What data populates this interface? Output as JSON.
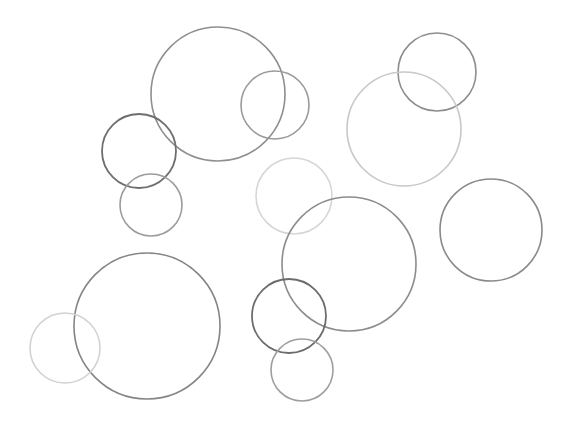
{
  "canvas": {
    "width": 576,
    "height": 421,
    "background": "#ffffff"
  },
  "circles": [
    {
      "cx": 218,
      "cy": 94,
      "r": 67,
      "stroke": "#8f8f8f",
      "width": 1.6
    },
    {
      "cx": 275,
      "cy": 105,
      "r": 34,
      "stroke": "#9a9a9a",
      "width": 1.6
    },
    {
      "cx": 139,
      "cy": 151,
      "r": 37,
      "stroke": "#6e6e6e",
      "width": 1.8
    },
    {
      "cx": 151,
      "cy": 205,
      "r": 31,
      "stroke": "#9c9c9c",
      "width": 1.6
    },
    {
      "cx": 437,
      "cy": 72,
      "r": 39,
      "stroke": "#8e8e8e",
      "width": 1.6
    },
    {
      "cx": 404,
      "cy": 129,
      "r": 57,
      "stroke": "#c8c8c8",
      "width": 1.6
    },
    {
      "cx": 294,
      "cy": 196,
      "r": 38,
      "stroke": "#d6d6d6",
      "width": 1.6
    },
    {
      "cx": 491,
      "cy": 230,
      "r": 51,
      "stroke": "#8a8a8a",
      "width": 1.6
    },
    {
      "cx": 349,
      "cy": 264,
      "r": 67,
      "stroke": "#8c8c8c",
      "width": 1.6
    },
    {
      "cx": 147,
      "cy": 326,
      "r": 73,
      "stroke": "#858585",
      "width": 1.6
    },
    {
      "cx": 65,
      "cy": 348,
      "r": 35,
      "stroke": "#d2d2d2",
      "width": 1.6
    },
    {
      "cx": 289,
      "cy": 316,
      "r": 37,
      "stroke": "#6c6c6c",
      "width": 1.8
    },
    {
      "cx": 302,
      "cy": 370,
      "r": 31,
      "stroke": "#9e9e9e",
      "width": 1.6
    }
  ]
}
